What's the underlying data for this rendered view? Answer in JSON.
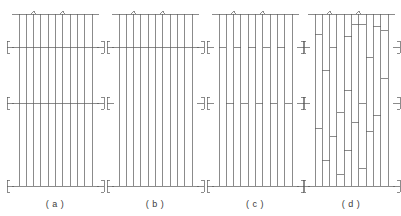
{
  "figure": {
    "background_color": "#ffffff",
    "line_color": "#5a5a5a",
    "caption_color": "#3a3a3a",
    "width": 401,
    "height": 216,
    "panel_count": 4,
    "vertical_member_count": 11
  },
  "geometry": {
    "panel_top_y": 14,
    "panel_bottom_y": 186,
    "rail_upper_y": 47,
    "rail_mid_y": 103,
    "caption_y": 207,
    "panel_width": 73,
    "panel_origin_x": [
      19,
      119,
      219,
      315
    ],
    "rail_overhang": 7
  },
  "panels": [
    {
      "id": "panel-a",
      "caption": "( a )",
      "caption_x": 55,
      "origin_x": 19,
      "description": "continuous full-width rails at top, upper, mid and bottom",
      "top_carets": [
        2,
        6
      ],
      "edge_brackets": [
        "upper",
        "mid",
        "bottom"
      ],
      "horizontals": [
        {
          "kind": "full",
          "y": 14,
          "overhang": 7
        },
        {
          "kind": "full",
          "y": 47,
          "overhang": 7
        },
        {
          "kind": "full",
          "y": 103,
          "overhang": 7
        },
        {
          "kind": "full",
          "y": 186,
          "overhang": 7
        }
      ],
      "segments": []
    },
    {
      "id": "panel-b",
      "caption": "( b )",
      "caption_x": 155,
      "origin_x": 119,
      "description": "continuous rails at top, upper and bottom; mid rail absent",
      "top_carets": [
        2,
        6
      ],
      "edge_brackets": [
        "upper",
        "mid",
        "bottom"
      ],
      "horizontals": [
        {
          "kind": "full",
          "y": 14,
          "overhang": 7
        },
        {
          "kind": "full",
          "y": 47,
          "overhang": 7
        },
        {
          "kind": "full",
          "y": 186,
          "overhang": 7
        }
      ],
      "segments": []
    },
    {
      "id": "panel-c",
      "caption": "( c )",
      "caption_x": 255,
      "origin_x": 219,
      "description": "top and bottom rails continuous; upper and mid rails broken into short bay segments",
      "top_carets": [
        2,
        6
      ],
      "edge_brackets": [
        "upper",
        "mid",
        "bottom"
      ],
      "horizontals": [
        {
          "kind": "full",
          "y": 14,
          "overhang": 7
        },
        {
          "kind": "full",
          "y": 186,
          "overhang": 7
        }
      ],
      "segments": [
        {
          "y": 47,
          "bay_start": 0,
          "bay_end": 1
        },
        {
          "y": 47,
          "bay_start": 2,
          "bay_end": 3
        },
        {
          "y": 47,
          "bay_start": 4,
          "bay_end": 5
        },
        {
          "y": 47,
          "bay_start": 6,
          "bay_end": 7
        },
        {
          "y": 47,
          "bay_start": 8,
          "bay_end": 9
        },
        {
          "y": 103,
          "bay_start": 1,
          "bay_end": 2
        },
        {
          "y": 103,
          "bay_start": 3,
          "bay_end": 4
        },
        {
          "y": 103,
          "bay_start": 5,
          "bay_end": 6
        },
        {
          "y": 103,
          "bay_start": 7,
          "bay_end": 8
        },
        {
          "y": 103,
          "bay_start": 9,
          "bay_end": 10
        }
      ]
    },
    {
      "id": "panel-d",
      "caption": "( d )",
      "caption_x": 351,
      "origin_x": 315,
      "description": "staggered short horizontal segments distributed irregularly over the panel height",
      "top_carets": [
        2,
        6
      ],
      "edge_brackets": [
        "upper",
        "mid",
        "bottom"
      ],
      "horizontals": [
        {
          "kind": "full",
          "y": 14,
          "overhang": 7
        },
        {
          "kind": "full",
          "y": 186,
          "overhang": 7
        }
      ],
      "segments": [
        {
          "y": 24,
          "bay_start": 5,
          "bay_end": 7
        },
        {
          "y": 26,
          "bay_start": 8,
          "bay_end": 9
        },
        {
          "y": 34,
          "bay_start": 0,
          "bay_end": 1
        },
        {
          "y": 36,
          "bay_start": 4,
          "bay_end": 5
        },
        {
          "y": 30,
          "bay_start": 9,
          "bay_end": 10
        },
        {
          "y": 47,
          "bay_start": 2,
          "bay_end": 3
        },
        {
          "y": 57,
          "bay_start": 7,
          "bay_end": 8
        },
        {
          "y": 70,
          "bay_start": 1,
          "bay_end": 2
        },
        {
          "y": 78,
          "bay_start": 9,
          "bay_end": 10
        },
        {
          "y": 90,
          "bay_start": 4,
          "bay_end": 5
        },
        {
          "y": 103,
          "bay_start": 6,
          "bay_end": 7
        },
        {
          "y": 112,
          "bay_start": 3,
          "bay_end": 4
        },
        {
          "y": 115,
          "bay_start": 8,
          "bay_end": 9
        },
        {
          "y": 122,
          "bay_start": 5,
          "bay_end": 6
        },
        {
          "y": 128,
          "bay_start": 0,
          "bay_end": 1
        },
        {
          "y": 131,
          "bay_start": 7,
          "bay_end": 8
        },
        {
          "y": 136,
          "bay_start": 2,
          "bay_end": 3
        },
        {
          "y": 150,
          "bay_start": 4,
          "bay_end": 5
        },
        {
          "y": 160,
          "bay_start": 1,
          "bay_end": 2
        },
        {
          "y": 168,
          "bay_start": 6,
          "bay_end": 7
        },
        {
          "y": 174,
          "bay_start": 3,
          "bay_end": 4
        }
      ]
    }
  ]
}
